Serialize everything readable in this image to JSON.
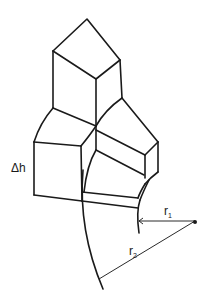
{
  "diagram": {
    "type": "geometric-isometric-blocks",
    "labels": {
      "height_delta": "Δh",
      "r1_main": "r",
      "r1_sub": "1",
      "r2_main": "r",
      "r2_sub": "2"
    },
    "colors": {
      "stroke": "#1a1a1a",
      "background": "#ffffff"
    },
    "elements": [
      "top-block",
      "right-block",
      "left-block",
      "bottom-slab",
      "inner-arc-r1",
      "outer-arc-r2",
      "center-point",
      "radius-line-r1",
      "radius-line-r2"
    ]
  }
}
